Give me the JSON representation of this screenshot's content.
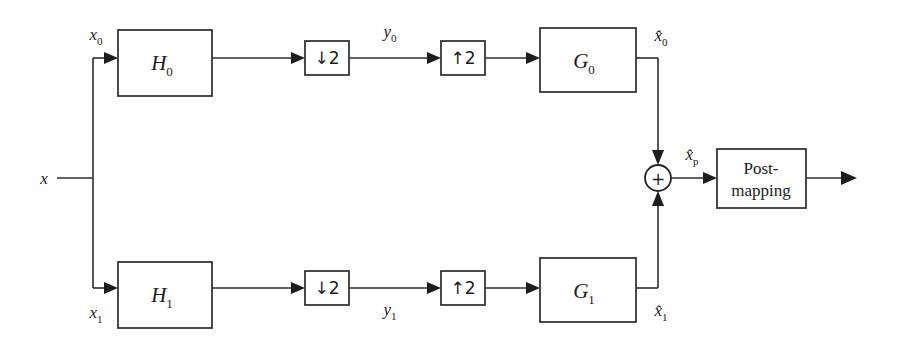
{
  "diagram": {
    "type": "block-diagram",
    "input": {
      "label": "x",
      "name": "input-signal"
    },
    "analysis_branches": [
      {
        "id": "upper",
        "input_label": "x",
        "input_sub": "0",
        "filter_label": "H",
        "filter_sub": "0",
        "downsampler_label": "↓2",
        "subband_label": "y",
        "subband_sub": "0",
        "upsampler_label": "↑2",
        "synthesis_label": "G",
        "synthesis_sub": "0",
        "recon_label": "x̂",
        "recon_sub": "0"
      },
      {
        "id": "lower",
        "input_label": "x",
        "input_sub": "1",
        "filter_label": "H",
        "filter_sub": "1",
        "downsampler_label": "↓2",
        "subband_label": "y",
        "subband_sub": "1",
        "upsampler_label": "↑2",
        "synthesis_label": "G",
        "synthesis_sub": "1",
        "recon_label": "x̂",
        "recon_sub": "1"
      }
    ],
    "adder": {
      "symbol": "+",
      "output_label": "x̂",
      "output_sub": "p"
    },
    "post_block": {
      "line1": "Post-",
      "line2": "mapping"
    },
    "colors": {
      "line": "#2e2e2e",
      "box_stroke": "#2b2b2b",
      "box_fill": "#ffffff",
      "text": "#1b1b1b",
      "background": "#fefefe"
    }
  }
}
